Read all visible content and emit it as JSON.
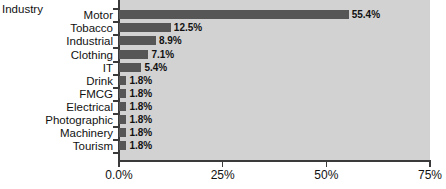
{
  "chart_data": {
    "type": "bar",
    "orientation": "horizontal",
    "title": "",
    "xlabel": "",
    "ylabel": "Industry",
    "categories": [
      "Motor",
      "Tobacco",
      "Industrial",
      "Clothing",
      "IT",
      "Drink",
      "FMCG",
      "Electrical",
      "Photographic",
      "Machinery",
      "Tourism"
    ],
    "values": [
      55.4,
      12.5,
      8.9,
      7.1,
      5.4,
      1.8,
      1.8,
      1.8,
      1.8,
      1.8,
      1.8
    ],
    "value_labels": [
      "55.4%",
      "12.5%",
      "8.9%",
      "7.1%",
      "5.4%",
      "1.8%",
      "1.8%",
      "1.8%",
      "1.8%",
      "1.8%",
      "1.8%"
    ],
    "xlim": [
      0,
      75
    ],
    "xticks": [
      0,
      25,
      50,
      75
    ],
    "xtick_labels": [
      "0.0%",
      "25%",
      "50%",
      "75%"
    ],
    "grid": false,
    "legend": false,
    "colors": {
      "bar": "#565656",
      "plot_background": "#d2d2d2",
      "figure_background": "#ffffff",
      "axis": "#3a3a3a",
      "text": "#111111"
    }
  }
}
